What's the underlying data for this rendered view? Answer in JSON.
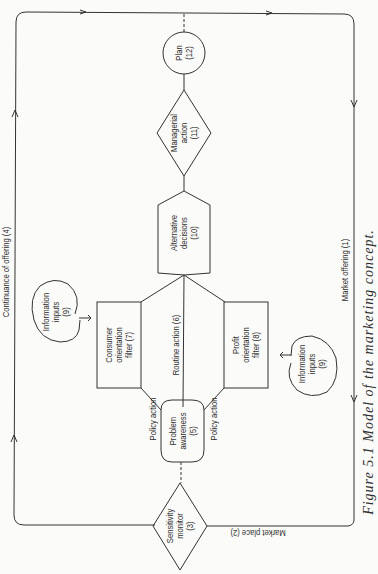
{
  "figure": {
    "caption": "Figure 5.1  Model of the marketing concept."
  },
  "nodes": {
    "market_offering": "Market offering (1)",
    "market_place": "Market place (2)",
    "sensitivity_monitor": {
      "line1": "Sensitivity",
      "line2": "monitor",
      "line3": "(3)"
    },
    "continuance": "Continuance of offering (4)",
    "problem_awareness": {
      "line1": "Problem",
      "line2": "awareness",
      "line3": "(5)"
    },
    "routine_action": "Routine action (6)",
    "consumer_filter": {
      "line1": "Consumer",
      "line2": "orientation",
      "line3": "filter (7)"
    },
    "profit_filter": {
      "line1": "Profit",
      "line2": "orientation",
      "line3": "filter (8)"
    },
    "info_inputs_top": {
      "line1": "Information",
      "line2": "inputs",
      "line3": "(9)"
    },
    "info_inputs_bottom": {
      "line1": "Information",
      "line2": "inputs",
      "line3": "(9)"
    },
    "alternative_decisions": {
      "line1": "Alternative",
      "line2": "decisions",
      "line3": "(10)"
    },
    "managerial_action": {
      "line1": "Managerial",
      "line2": "action",
      "line3": "(11)"
    },
    "plan": {
      "line1": "Plan",
      "line2": "(12)"
    }
  },
  "edge_labels": {
    "policy_action_left": "Policy action",
    "policy_action_right": "Policy action"
  }
}
